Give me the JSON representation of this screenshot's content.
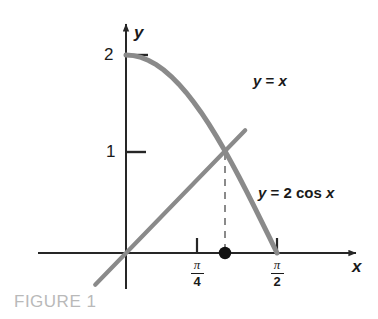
{
  "figure": {
    "caption": "FIGURE 1",
    "caption_color": "#b9b9b9",
    "background": "#ffffff"
  },
  "axes": {
    "x_axis_label": "x",
    "y_axis_label": "y",
    "axis_color": "#262626",
    "y_ticks": [
      {
        "label": "2",
        "value": 2
      },
      {
        "label": "1",
        "value": 1
      }
    ],
    "x_ticks": [
      {
        "label": "π/4",
        "numerator": "π",
        "denominator": "4",
        "value": 0.7853981634
      },
      {
        "label": "π/2",
        "numerator": "π",
        "denominator": "2",
        "value": 1.5707963268
      }
    ]
  },
  "curves": [
    {
      "name": "identity-line",
      "label_y": "y",
      "label_eq": "=",
      "label_rhs": "x",
      "label_full": "y = x",
      "color": "#8a8a8a"
    },
    {
      "name": "cosine-curve",
      "label_y": "y",
      "label_eq": "=",
      "label_rhs": "2 cos",
      "label_var": "x",
      "label_full": "y = 2 cos x",
      "color": "#8a8a8a"
    }
  ],
  "annotations": {
    "intersection_dot_color": "#111111",
    "dashed_line_color": "#8a8a8a"
  },
  "chart_data": {
    "type": "line",
    "title": "",
    "xlabel": "x",
    "ylabel": "y",
    "xlim": [
      -0.35,
      1.95
    ],
    "ylim": [
      -0.55,
      2.35
    ],
    "grid": false,
    "legend": "inline-labels",
    "series": [
      {
        "name": "y = 2 cos x",
        "color": "#8a8a8a",
        "x": [
          0,
          0.0785,
          0.1571,
          0.2356,
          0.3142,
          0.3927,
          0.4712,
          0.5498,
          0.6283,
          0.7069,
          0.7854,
          0.8639,
          0.9425,
          1.021,
          1.0996,
          1.1781,
          1.2566,
          1.3352,
          1.4137,
          1.4923,
          1.5708
        ],
        "y": [
          2.0,
          1.9938,
          1.9754,
          1.9449,
          1.9021,
          1.8478,
          1.782,
          1.7053,
          1.618,
          1.5209,
          1.4142,
          1.299,
          1.1756,
          1.0451,
          0.908,
          0.7654,
          0.618,
          0.4668,
          0.3129,
          0.1571,
          0.0
        ]
      },
      {
        "name": "y = x",
        "color": "#8a8a8a",
        "x": [
          -0.32,
          0,
          0.7854,
          1.0299,
          1.24
        ],
        "y": [
          -0.32,
          0,
          0.7854,
          1.0299,
          1.24
        ]
      }
    ],
    "annotations": [
      {
        "type": "point",
        "x": 1.0299,
        "y": 0,
        "marker": "filled-circle",
        "color": "#111111"
      },
      {
        "type": "vline-dashed",
        "x": 1.0299,
        "y_from": 0,
        "y_to": 1.0299,
        "color": "#8a8a8a"
      },
      {
        "type": "intersection",
        "x": 1.0299,
        "y": 1.0299
      }
    ]
  }
}
